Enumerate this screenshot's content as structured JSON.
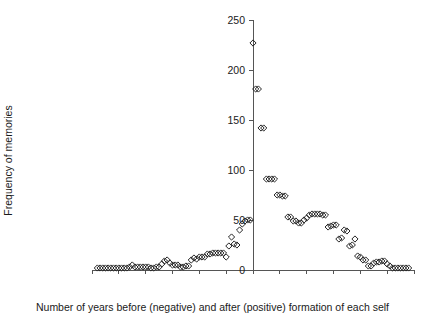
{
  "chart": {
    "type": "scatter",
    "title": "",
    "xlabel": "Number of years before (negative) and after (positive) formation of each self",
    "ylabel": "Frequency of memories",
    "marker_shape": "open-diamond",
    "marker_color": "#262626",
    "axis_color": "#555555",
    "background": "#ffffff",
    "grid": false,
    "legend": false
  },
  "chart_data": {
    "type": "scatter",
    "title": "",
    "xlabel": "Number of years before (negative) and after (positive) formation of each self",
    "ylabel": "Frequency of memories",
    "xlim": [
      -60,
      60
    ],
    "ylim": [
      0,
      250
    ],
    "xticks": [
      -60,
      -50,
      -40,
      -30,
      -20,
      -10,
      0,
      10,
      20,
      30,
      40,
      50,
      60
    ],
    "yticks": [
      0,
      50,
      100,
      150,
      200,
      250
    ],
    "xticklabels": [
      "-60",
      "-50",
      "-40",
      "-30",
      "-20",
      "-10",
      "0",
      "10",
      "20",
      "30",
      "40",
      "50",
      "60"
    ],
    "yticklabels": [
      "0",
      "50",
      "100",
      "150",
      "200",
      "250"
    ],
    "grid": false,
    "legend": false,
    "series": [
      {
        "name": "Frequency of memories",
        "x": [
          -58,
          -57,
          -56,
          -55,
          -54,
          -53,
          -52,
          -51,
          -50,
          -49,
          -48,
          -47,
          -46,
          -45,
          -44,
          -43,
          -42,
          -41,
          -40,
          -39,
          -38,
          -37,
          -36,
          -35,
          -34,
          -33,
          -32,
          -31,
          -30,
          -29,
          -28,
          -27,
          -26,
          -25,
          -24,
          -23,
          -22,
          -21,
          -20,
          -19,
          -18,
          -17,
          -16,
          -15,
          -14,
          -13,
          -12,
          -11,
          -10,
          -9,
          -8,
          -7,
          -6,
          -5,
          -4,
          -3,
          -2,
          -1,
          0,
          1,
          2,
          3,
          4,
          5,
          6,
          7,
          8,
          9,
          10,
          11,
          12,
          13,
          14,
          15,
          16,
          17,
          18,
          19,
          20,
          21,
          22,
          23,
          24,
          25,
          26,
          27,
          28,
          29,
          30,
          31,
          32,
          33,
          34,
          35,
          36,
          37,
          38,
          39,
          40,
          41,
          42,
          43,
          44,
          45,
          46,
          47,
          48,
          49,
          50,
          51,
          52,
          53,
          54,
          55,
          56,
          57,
          58
        ],
        "y": [
          2,
          2,
          2,
          2,
          2,
          2,
          2,
          2,
          2,
          2,
          2,
          2,
          3,
          5,
          3,
          3,
          3,
          3,
          3,
          3,
          2,
          2,
          3,
          3,
          6,
          9,
          10,
          7,
          5,
          5,
          5,
          3,
          3,
          4,
          4,
          10,
          12,
          11,
          13,
          13,
          13,
          16,
          16,
          17,
          17,
          17,
          17,
          17,
          13,
          24,
          33,
          26,
          25,
          40,
          46,
          49,
          50,
          50,
          227,
          181,
          181,
          142,
          142,
          91,
          91,
          91,
          91,
          75,
          75,
          74,
          74,
          53,
          53,
          49,
          49,
          47,
          47,
          50,
          52,
          55,
          56,
          56,
          56,
          56,
          55,
          55,
          43,
          44,
          45,
          45,
          31,
          32,
          40,
          39,
          24,
          25,
          31,
          14,
          13,
          10,
          10,
          4,
          4,
          7,
          8,
          8,
          9,
          9,
          6,
          4,
          2,
          2,
          2,
          2,
          2,
          2,
          2
        ]
      }
    ]
  }
}
